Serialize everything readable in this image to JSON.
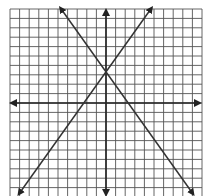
{
  "chart_data": {
    "type": "line",
    "title": "",
    "xlabel": "",
    "ylabel": "",
    "grid": true,
    "xlim": [
      -10,
      10
    ],
    "ylim": [
      -10,
      10
    ],
    "grid_step": 1,
    "axes_arrows": true,
    "series": [
      {
        "name": "line-increasing",
        "equation": "y = 1.5x + 3",
        "slope": 1.5,
        "intercept": 3,
        "x": [
          -9,
          4.67
        ],
        "y": [
          -10.5,
          10
        ]
      },
      {
        "name": "line-decreasing",
        "equation": "y = -1.5x + 3",
        "slope": -1.5,
        "intercept": 3,
        "x": [
          -4.67,
          9
        ],
        "y": [
          10,
          -10.5
        ]
      }
    ],
    "intersection": {
      "x": 0,
      "y": 3
    }
  },
  "colors": {
    "grid": "#555555",
    "axis": "#222222",
    "line": "#333333",
    "background": "#ffffff"
  }
}
